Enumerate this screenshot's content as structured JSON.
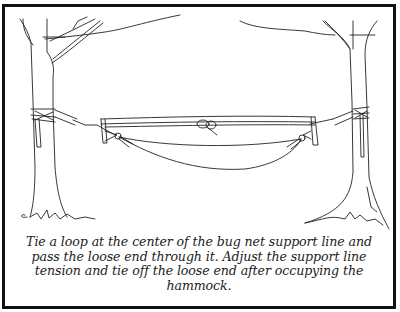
{
  "figure": {
    "illustration": {
      "subject": "hammock-with-bug-net-between-two-trees",
      "elements": [
        "left-tree",
        "right-tree",
        "tree-straps",
        "suspension-lines",
        "spreader-bars",
        "center-loop-knot",
        "hammock-body",
        "branches"
      ]
    },
    "caption": {
      "lines": [
        "Tie a loop at the center of the bug net support line and",
        "pass the loose end through it. Adjust the support line",
        "tension and tie off the loose end after occupying the",
        "hammock."
      ]
    },
    "colors": {
      "border": "#111111",
      "line_art": "#222222",
      "background": "#ffffff"
    }
  }
}
